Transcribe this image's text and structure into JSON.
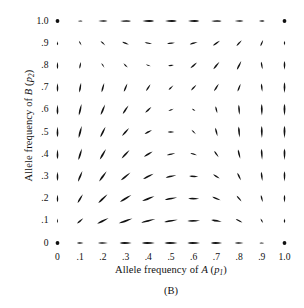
{
  "figure": {
    "caption": "(B)",
    "type": "vector-field-phase-plane"
  },
  "axes": {
    "xlabel_prefix": "Allele frequency of ",
    "xlabel_var": "A",
    "xlabel_paren_open": " (",
    "xlabel_sym": "p",
    "xlabel_sub": "1",
    "xlabel_paren_close": ")",
    "ylabel_prefix": "Allele frequency of ",
    "ylabel_var": "B",
    "ylabel_paren_open": " (",
    "ylabel_sym": "p",
    "ylabel_sub": "2",
    "ylabel_paren_close": ")"
  },
  "chart_data": {
    "type": "scatter",
    "subtype": "quiver",
    "title": "",
    "xlabel": "Allele frequency of A (p1)",
    "ylabel": "Allele frequency of B (p2)",
    "xlim": [
      0,
      1
    ],
    "ylim": [
      0,
      1
    ],
    "grid": false,
    "legend": null,
    "xticks": [
      "0",
      ".1",
      ".2",
      ".3",
      ".4",
      ".5",
      ".6",
      ".7",
      ".8",
      ".9",
      "1.0"
    ],
    "yticks": [
      "0",
      ".1",
      ".2",
      ".3",
      ".4",
      ".5",
      ".6",
      ".7",
      ".8",
      ".9",
      "1.0"
    ],
    "xtickvalues": [
      0,
      0.1,
      0.2,
      0.3,
      0.4,
      0.5,
      0.6,
      0.7,
      0.8,
      0.9,
      1.0
    ],
    "ytickvalues": [
      0,
      0.1,
      0.2,
      0.3,
      0.4,
      0.5,
      0.6,
      0.7,
      0.8,
      0.9,
      1.0
    ],
    "arrow_color": "#111111",
    "fixed_points": [
      {
        "x": 0,
        "y": 0,
        "marker": "dot"
      },
      {
        "x": 1,
        "y": 0,
        "marker": "dot"
      },
      {
        "x": 0,
        "y": 1,
        "marker": "dot"
      },
      {
        "x": 1,
        "y": 1,
        "marker": "dot"
      }
    ],
    "vectors": [
      {
        "x": 0.0,
        "y": 0.0,
        "dx": 0.0,
        "dy": 0.0
      },
      {
        "x": 0.1,
        "y": 0.0,
        "dx": 0.3,
        "dy": 0.0
      },
      {
        "x": 0.2,
        "y": 0.0,
        "dx": 0.45,
        "dy": 0.0
      },
      {
        "x": 0.3,
        "y": 0.0,
        "dx": 0.55,
        "dy": 0.0
      },
      {
        "x": 0.4,
        "y": 0.0,
        "dx": 0.6,
        "dy": 0.0
      },
      {
        "x": 0.5,
        "y": 0.0,
        "dx": 0.6,
        "dy": 0.0
      },
      {
        "x": 0.6,
        "y": 0.0,
        "dx": 0.58,
        "dy": 0.0
      },
      {
        "x": 0.7,
        "y": 0.0,
        "dx": 0.52,
        "dy": 0.0
      },
      {
        "x": 0.8,
        "y": 0.0,
        "dx": 0.4,
        "dy": 0.0
      },
      {
        "x": 0.9,
        "y": 0.0,
        "dx": 0.22,
        "dy": 0.0
      },
      {
        "x": 1.0,
        "y": 0.0,
        "dx": 0.0,
        "dy": 0.0
      },
      {
        "x": 0.0,
        "y": 0.1,
        "dx": 0.0,
        "dy": 0.22
      },
      {
        "x": 0.1,
        "y": 0.1,
        "dx": 0.28,
        "dy": 0.24
      },
      {
        "x": 0.2,
        "y": 0.1,
        "dx": 0.52,
        "dy": 0.26
      },
      {
        "x": 0.3,
        "y": 0.1,
        "dx": 0.62,
        "dy": 0.22
      },
      {
        "x": 0.4,
        "y": 0.1,
        "dx": 0.64,
        "dy": 0.16
      },
      {
        "x": 0.5,
        "y": 0.1,
        "dx": 0.62,
        "dy": 0.1
      },
      {
        "x": 0.6,
        "y": 0.1,
        "dx": 0.58,
        "dy": 0.02
      },
      {
        "x": 0.7,
        "y": 0.1,
        "dx": 0.48,
        "dy": -0.08
      },
      {
        "x": 0.8,
        "y": 0.1,
        "dx": 0.3,
        "dy": -0.16
      },
      {
        "x": 0.9,
        "y": 0.1,
        "dx": 0.12,
        "dy": -0.2
      },
      {
        "x": 1.0,
        "y": 0.1,
        "dx": 0.0,
        "dy": -0.22
      },
      {
        "x": 0.0,
        "y": 0.2,
        "dx": 0.0,
        "dy": 0.34
      },
      {
        "x": 0.1,
        "y": 0.2,
        "dx": 0.24,
        "dy": 0.4
      },
      {
        "x": 0.2,
        "y": 0.2,
        "dx": 0.42,
        "dy": 0.4
      },
      {
        "x": 0.3,
        "y": 0.2,
        "dx": 0.52,
        "dy": 0.32
      },
      {
        "x": 0.4,
        "y": 0.2,
        "dx": 0.56,
        "dy": 0.22
      },
      {
        "x": 0.5,
        "y": 0.2,
        "dx": 0.56,
        "dy": 0.1
      },
      {
        "x": 0.6,
        "y": 0.2,
        "dx": 0.5,
        "dy": -0.02
      },
      {
        "x": 0.7,
        "y": 0.2,
        "dx": 0.38,
        "dy": -0.16
      },
      {
        "x": 0.8,
        "y": 0.2,
        "dx": 0.22,
        "dy": -0.26
      },
      {
        "x": 0.9,
        "y": 0.2,
        "dx": 0.08,
        "dy": -0.32
      },
      {
        "x": 1.0,
        "y": 0.2,
        "dx": 0.0,
        "dy": -0.36
      },
      {
        "x": 0.0,
        "y": 0.3,
        "dx": 0.0,
        "dy": 0.42
      },
      {
        "x": 0.1,
        "y": 0.3,
        "dx": 0.2,
        "dy": 0.48
      },
      {
        "x": 0.2,
        "y": 0.3,
        "dx": 0.34,
        "dy": 0.46
      },
      {
        "x": 0.3,
        "y": 0.3,
        "dx": 0.44,
        "dy": 0.36
      },
      {
        "x": 0.4,
        "y": 0.3,
        "dx": 0.48,
        "dy": 0.24
      },
      {
        "x": 0.5,
        "y": 0.3,
        "dx": 0.48,
        "dy": 0.1
      },
      {
        "x": 0.6,
        "y": 0.3,
        "dx": 0.42,
        "dy": -0.04
      },
      {
        "x": 0.7,
        "y": 0.3,
        "dx": 0.3,
        "dy": -0.2
      },
      {
        "x": 0.8,
        "y": 0.3,
        "dx": 0.16,
        "dy": -0.34
      },
      {
        "x": 0.9,
        "y": 0.3,
        "dx": 0.05,
        "dy": -0.42
      },
      {
        "x": 1.0,
        "y": 0.3,
        "dx": 0.0,
        "dy": -0.46
      },
      {
        "x": 0.0,
        "y": 0.4,
        "dx": 0.0,
        "dy": 0.46
      },
      {
        "x": 0.1,
        "y": 0.4,
        "dx": 0.16,
        "dy": 0.52
      },
      {
        "x": 0.2,
        "y": 0.4,
        "dx": 0.28,
        "dy": 0.48
      },
      {
        "x": 0.3,
        "y": 0.4,
        "dx": 0.36,
        "dy": 0.38
      },
      {
        "x": 0.4,
        "y": 0.4,
        "dx": 0.4,
        "dy": 0.24
      },
      {
        "x": 0.5,
        "y": 0.4,
        "dx": 0.38,
        "dy": 0.08
      },
      {
        "x": 0.6,
        "y": 0.4,
        "dx": 0.3,
        "dy": -0.1
      },
      {
        "x": 0.7,
        "y": 0.4,
        "dx": 0.2,
        "dy": -0.28
      },
      {
        "x": 0.8,
        "y": 0.4,
        "dx": 0.1,
        "dy": -0.42
      },
      {
        "x": 0.9,
        "y": 0.4,
        "dx": 0.03,
        "dy": -0.5
      },
      {
        "x": 1.0,
        "y": 0.4,
        "dx": 0.0,
        "dy": -0.52
      },
      {
        "x": 0.0,
        "y": 0.5,
        "dx": 0.0,
        "dy": 0.48
      },
      {
        "x": 0.1,
        "y": 0.5,
        "dx": 0.14,
        "dy": 0.54
      },
      {
        "x": 0.2,
        "y": 0.5,
        "dx": 0.24,
        "dy": 0.48
      },
      {
        "x": 0.3,
        "y": 0.5,
        "dx": 0.32,
        "dy": 0.36
      },
      {
        "x": 0.4,
        "y": 0.5,
        "dx": 0.34,
        "dy": 0.18
      },
      {
        "x": 0.5,
        "y": 0.5,
        "dx": 0.3,
        "dy": 0.0
      },
      {
        "x": 0.6,
        "y": 0.5,
        "dx": 0.2,
        "dy": -0.2
      },
      {
        "x": 0.7,
        "y": 0.5,
        "dx": 0.1,
        "dy": -0.38
      },
      {
        "x": 0.8,
        "y": 0.5,
        "dx": 0.04,
        "dy": -0.5
      },
      {
        "x": 0.9,
        "y": 0.5,
        "dx": 0.01,
        "dy": -0.55
      },
      {
        "x": 1.0,
        "y": 0.5,
        "dx": 0.0,
        "dy": -0.56
      },
      {
        "x": 0.0,
        "y": 0.6,
        "dx": 0.0,
        "dy": 0.46
      },
      {
        "x": 0.1,
        "y": 0.6,
        "dx": 0.12,
        "dy": 0.52
      },
      {
        "x": 0.2,
        "y": 0.6,
        "dx": 0.2,
        "dy": 0.48
      },
      {
        "x": 0.3,
        "y": 0.6,
        "dx": 0.26,
        "dy": 0.38
      },
      {
        "x": 0.4,
        "y": 0.6,
        "dx": 0.28,
        "dy": 0.26
      },
      {
        "x": 0.5,
        "y": 0.6,
        "dx": 0.24,
        "dy": 0.1
      },
      {
        "x": 0.6,
        "y": 0.6,
        "dx": 0.16,
        "dy": -0.1
      },
      {
        "x": 0.7,
        "y": 0.6,
        "dx": 0.08,
        "dy": -0.32
      },
      {
        "x": 0.8,
        "y": 0.6,
        "dx": 0.03,
        "dy": -0.46
      },
      {
        "x": 0.9,
        "y": 0.6,
        "dx": 0.01,
        "dy": -0.52
      },
      {
        "x": 1.0,
        "y": 0.6,
        "dx": 0.0,
        "dy": -0.54
      },
      {
        "x": 0.0,
        "y": 0.7,
        "dx": 0.0,
        "dy": 0.4
      },
      {
        "x": 0.1,
        "y": 0.7,
        "dx": 0.08,
        "dy": 0.44
      },
      {
        "x": 0.2,
        "y": 0.7,
        "dx": 0.12,
        "dy": 0.42
      },
      {
        "x": 0.3,
        "y": 0.7,
        "dx": 0.16,
        "dy": 0.38
      },
      {
        "x": 0.4,
        "y": 0.7,
        "dx": 0.2,
        "dy": 0.3
      },
      {
        "x": 0.5,
        "y": 0.7,
        "dx": 0.22,
        "dy": 0.22
      },
      {
        "x": 0.6,
        "y": 0.7,
        "dx": 0.24,
        "dy": 0.26
      },
      {
        "x": 0.7,
        "y": 0.7,
        "dx": 0.22,
        "dy": 0.34
      },
      {
        "x": 0.8,
        "y": 0.7,
        "dx": 0.14,
        "dy": 0.36
      },
      {
        "x": 0.9,
        "y": 0.7,
        "dx": 0.04,
        "dy": -0.38
      },
      {
        "x": 1.0,
        "y": 0.7,
        "dx": 0.0,
        "dy": -0.48
      },
      {
        "x": 0.0,
        "y": 0.8,
        "dx": 0.0,
        "dy": 0.32
      },
      {
        "x": 0.1,
        "y": 0.8,
        "dx": 0.06,
        "dy": 0.3
      },
      {
        "x": 0.2,
        "y": 0.8,
        "dx": 0.14,
        "dy": -0.22
      },
      {
        "x": 0.3,
        "y": 0.8,
        "dx": 0.2,
        "dy": -0.2
      },
      {
        "x": 0.4,
        "y": 0.8,
        "dx": 0.22,
        "dy": -0.08
      },
      {
        "x": 0.5,
        "y": 0.8,
        "dx": 0.26,
        "dy": 0.04
      },
      {
        "x": 0.6,
        "y": 0.8,
        "dx": 0.3,
        "dy": 0.26
      },
      {
        "x": 0.7,
        "y": 0.8,
        "dx": 0.28,
        "dy": 0.34
      },
      {
        "x": 0.8,
        "y": 0.8,
        "dx": 0.2,
        "dy": 0.4
      },
      {
        "x": 0.9,
        "y": 0.8,
        "dx": 0.06,
        "dy": -0.34
      },
      {
        "x": 1.0,
        "y": 0.8,
        "dx": 0.0,
        "dy": -0.4
      },
      {
        "x": 0.0,
        "y": 0.9,
        "dx": 0.0,
        "dy": 0.18
      },
      {
        "x": 0.1,
        "y": 0.9,
        "dx": 0.12,
        "dy": -0.22
      },
      {
        "x": 0.2,
        "y": 0.9,
        "dx": 0.22,
        "dy": -0.2
      },
      {
        "x": 0.3,
        "y": 0.9,
        "dx": 0.3,
        "dy": -0.12
      },
      {
        "x": 0.4,
        "y": 0.9,
        "dx": 0.34,
        "dy": -0.06
      },
      {
        "x": 0.5,
        "y": 0.9,
        "dx": 0.36,
        "dy": 0.04
      },
      {
        "x": 0.6,
        "y": 0.9,
        "dx": 0.36,
        "dy": 0.1
      },
      {
        "x": 0.7,
        "y": 0.9,
        "dx": 0.32,
        "dy": 0.22
      },
      {
        "x": 0.8,
        "y": 0.9,
        "dx": 0.24,
        "dy": 0.26
      },
      {
        "x": 0.9,
        "y": 0.9,
        "dx": 0.12,
        "dy": 0.28
      },
      {
        "x": 1.0,
        "y": 0.9,
        "dx": 0.0,
        "dy": -0.22
      },
      {
        "x": 0.0,
        "y": 1.0,
        "dx": 0.0,
        "dy": 0.0
      },
      {
        "x": 0.1,
        "y": 1.0,
        "dx": -0.22,
        "dy": 0.0
      },
      {
        "x": 0.2,
        "y": 1.0,
        "dx": -0.42,
        "dy": 0.0
      },
      {
        "x": 0.3,
        "y": 1.0,
        "dx": -0.5,
        "dy": 0.0
      },
      {
        "x": 0.4,
        "y": 1.0,
        "dx": -0.54,
        "dy": 0.0
      },
      {
        "x": 0.5,
        "y": 1.0,
        "dx": -0.54,
        "dy": 0.0
      },
      {
        "x": 0.6,
        "y": 1.0,
        "dx": -0.52,
        "dy": 0.0
      },
      {
        "x": 0.7,
        "y": 1.0,
        "dx": -0.48,
        "dy": 0.0
      },
      {
        "x": 0.8,
        "y": 1.0,
        "dx": -0.4,
        "dy": 0.0
      },
      {
        "x": 0.9,
        "y": 1.0,
        "dx": -0.26,
        "dy": 0.0
      },
      {
        "x": 1.0,
        "y": 1.0,
        "dx": 0.0,
        "dy": 0.0
      }
    ]
  }
}
